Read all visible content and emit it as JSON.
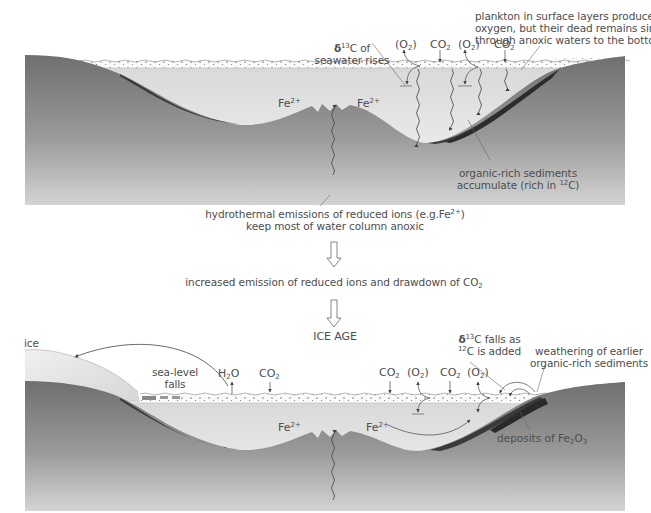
{
  "figure": {
    "top_panel": {
      "labels": {
        "plankton_note": [
          "plankton in surface layers produce",
          "oxygen, but their dead remains sink",
          "through anoxic waters to the bottom"
        ],
        "delta13c_rises": [
          "δ",
          "13",
          "C of",
          "seawater rises"
        ],
        "gases": [
          "(O",
          "2",
          ")",
          "CO",
          "2",
          "(O",
          "2",
          ")",
          "CO",
          "2"
        ],
        "fe_left": [
          "Fe",
          "2+"
        ],
        "fe_right": [
          "Fe",
          "2+"
        ],
        "sediments_note": [
          "organic-rich sediments",
          "accumulate (rich in ",
          "12",
          "C)"
        ],
        "hydrothermal_note": [
          "hydrothermal emissions of reduced ions (e.g.Fe",
          "2+",
          ")",
          "keep most of water  column anoxic"
        ]
      }
    },
    "flow": {
      "step1": [
        "increased emission of reduced ions and drawdown of CO",
        "2"
      ],
      "step2": "ICE  AGE"
    },
    "bottom_panel": {
      "labels": {
        "ice": "ice",
        "sea_level": [
          "sea-level",
          "falls"
        ],
        "h2o": [
          "H",
          "2",
          "O"
        ],
        "co2_left": [
          "CO",
          "2"
        ],
        "gases": [
          "CO",
          "2",
          "(O",
          "2",
          ")",
          "CO",
          "2",
          "(O",
          "2",
          ")"
        ],
        "delta13c_falls": [
          "δ",
          "13",
          "C  falls as",
          "12",
          "C is added"
        ],
        "weathering_note": [
          "weathering of earlier",
          "organic-rich sediments"
        ],
        "fe_left": [
          "Fe",
          "2+"
        ],
        "fe_right": [
          "Fe",
          "2+"
        ],
        "deposits_note": [
          "deposits of Fe",
          "2",
          "O",
          "3"
        ]
      }
    },
    "colors": {
      "rock_dark": "#707070",
      "rock_light": "#c9c9c9",
      "water_top": "#e8e8e8",
      "water_bottom": "#f7f7f7",
      "sediment": "#3d3d3d",
      "text": "#4d4d4d",
      "line": "#555555"
    }
  }
}
